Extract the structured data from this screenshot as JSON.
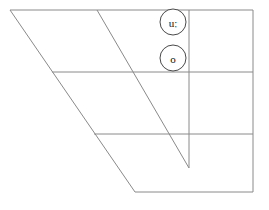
{
  "diagram": {
    "type": "ipa-vowel-chart",
    "background_color": "#ffffff",
    "line_color": "#8a8a8a",
    "marker_stroke_color": "#4a4a4a",
    "marker_fill_color": "#ffffff",
    "label_color": "#111111",
    "canvas": {
      "width": 269,
      "height": 210
    },
    "outline": {
      "name": "trapezoid-outline",
      "points": "10,10 253,10 253,192 135,192"
    },
    "horizontal_lines": [
      {
        "name": "top-edge",
        "x1": 10,
        "y1": 10,
        "x2": 253,
        "y2": 10
      },
      {
        "name": "close-mid-line",
        "x1": 52,
        "y1": 72,
        "x2": 253,
        "y2": 72
      },
      {
        "name": "open-mid-line",
        "x1": 94,
        "y1": 134,
        "x2": 253,
        "y2": 134
      },
      {
        "name": "bottom-edge",
        "x1": 135,
        "y1": 192,
        "x2": 253,
        "y2": 192
      }
    ],
    "diagonal_lines": [
      {
        "name": "front-edge-diagonal",
        "x1": 10,
        "y1": 10,
        "x2": 135,
        "y2": 192
      },
      {
        "name": "central-diagonal",
        "x1": 97,
        "y1": 10,
        "x2": 189,
        "y2": 168
      }
    ],
    "vertical_lines": [
      {
        "name": "back-divider",
        "x1": 189,
        "y1": 10,
        "x2": 189,
        "y2": 168
      },
      {
        "name": "right-edge",
        "x1": 253,
        "y1": 10,
        "x2": 253,
        "y2": 192
      }
    ],
    "markers": [
      {
        "name": "vowel-marker-u-long",
        "symbol": "uː",
        "cx": 173,
        "cy": 22,
        "r": 13
      },
      {
        "name": "vowel-marker-o",
        "symbol": "o",
        "cx": 173,
        "cy": 58,
        "r": 13
      }
    ]
  }
}
